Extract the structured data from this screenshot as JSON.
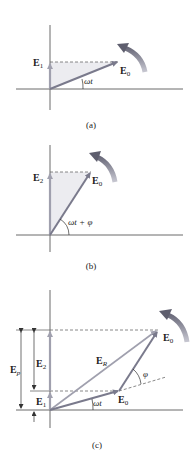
{
  "colors": {
    "axis": "#6b6b6b",
    "phasor": "#7a7a8c",
    "phasor_light": "#a0a0ae",
    "dashed": "#6b6b6b",
    "shade": "#ececf0",
    "rotation_arrow": "#8a8a98",
    "text": "#222222"
  },
  "panels": [
    {
      "caption": "(a)",
      "labels": {
        "e1": "E",
        "e1_sub": "1",
        "e0": "E",
        "e0_sub": "0",
        "angle": "ωt"
      }
    },
    {
      "caption": "(b)",
      "labels": {
        "e2": "E",
        "e2_sub": "2",
        "e0": "E",
        "e0_sub": "0",
        "angle": "ωt + φ"
      }
    },
    {
      "caption": "(c)",
      "labels": {
        "ep": "E",
        "ep_sub": "p",
        "e2": "E",
        "e2_sub": "2",
        "e1": "E",
        "e1_sub": "1",
        "er": "E",
        "er_sub": "R",
        "e0_top": "E",
        "e0_top_sub": "0",
        "e0_mid": "E",
        "e0_mid_sub": "0",
        "angle_wt": "ωt",
        "angle_phi": "φ"
      }
    }
  ]
}
